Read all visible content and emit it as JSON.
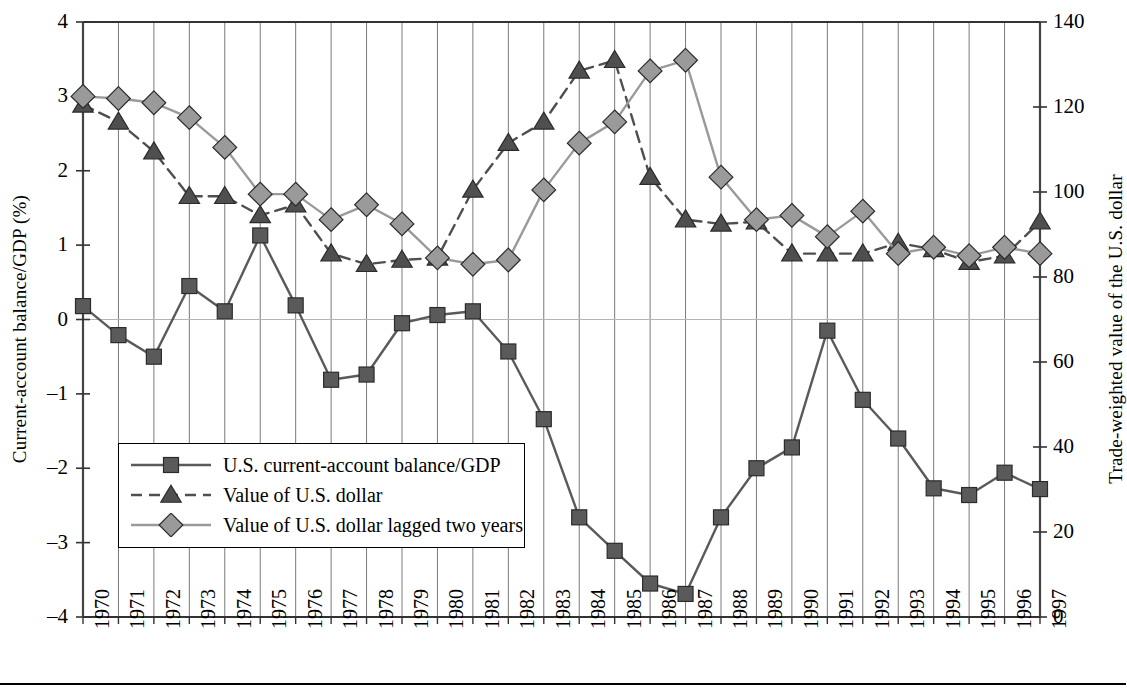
{
  "axes": {
    "y_left": {
      "title": "Current-account balance/GDP (%)",
      "ticks": [
        "4",
        "3",
        "2",
        "1",
        "0",
        "–1",
        "–2",
        "–3",
        "–4"
      ],
      "min": -4,
      "max": 4
    },
    "y_right": {
      "title": "Trade-weighted value of the U.S. dollar",
      "ticks": [
        "140",
        "120",
        "100",
        "80",
        "60",
        "40",
        "20",
        "0"
      ],
      "min": 0,
      "max": 140
    },
    "x": {
      "ticks": [
        "1970",
        "1971",
        "1972",
        "1973",
        "1974",
        "1975",
        "1976",
        "1977",
        "1978",
        "1979",
        "1980",
        "1981",
        "1982",
        "1983",
        "1984",
        "1985",
        "1986",
        "1987",
        "1988",
        "1989",
        "1990",
        "1991",
        "1992",
        "1993",
        "1994",
        "1995",
        "1996",
        "1997"
      ]
    }
  },
  "legend": {
    "items": [
      {
        "label": "U.S. current-account balance/GDP",
        "marker": "square",
        "color": "#5a5a5a",
        "dash": "solid"
      },
      {
        "label": "Value of U.S. dollar",
        "marker": "triangle",
        "color": "#4f4f4f",
        "dash": "dashed"
      },
      {
        "label": "Value of U.S. dollar lagged two years",
        "marker": "diamond",
        "color": "#9a9a9a",
        "dash": "solid"
      }
    ]
  },
  "colors": {
    "balance": "#5a5a5a",
    "dollar": "#4f4f4f",
    "dollar_lagged": "#9a9a9a",
    "grid": "#7a7a7a",
    "axis": "#3c3c3c",
    "zero_line": "#b4b4b4"
  },
  "chart_data": {
    "type": "line",
    "title": "",
    "xlabel": "",
    "ylabel": "Current-account balance/GDP (%)",
    "y2label": "Trade-weighted value of the U.S. dollar",
    "xlim": [
      1970,
      1997
    ],
    "ylim": [
      -4,
      4
    ],
    "y2lim": [
      0,
      140
    ],
    "grid": true,
    "legend_position": "inside-lower-left",
    "x": [
      1970,
      1971,
      1972,
      1973,
      1974,
      1975,
      1976,
      1977,
      1978,
      1979,
      1980,
      1981,
      1982,
      1983,
      1984,
      1985,
      1986,
      1987,
      1988,
      1989,
      1990,
      1991,
      1992,
      1993,
      1994,
      1995,
      1996,
      1997
    ],
    "series": [
      {
        "name": "U.S. current-account balance/GDP",
        "axis": "left",
        "unit": "%",
        "marker": "square",
        "dash": "solid",
        "color": "#5a5a5a",
        "values": [
          0.18,
          -0.21,
          -0.5,
          0.45,
          0.11,
          1.13,
          0.19,
          -0.81,
          -0.74,
          -0.05,
          0.06,
          0.11,
          -0.43,
          -1.34,
          -2.66,
          -3.11,
          -3.55,
          -3.69,
          -2.66,
          -2.0,
          -1.72,
          -0.15,
          -1.08,
          -1.6,
          -2.27,
          -2.36,
          -2.06,
          -2.28
        ]
      },
      {
        "name": "Value of U.S. dollar",
        "axis": "right",
        "unit": "index",
        "marker": "triangle",
        "dash": "dashed",
        "color": "#4f4f4f",
        "values": [
          120.5,
          116.5,
          109.5,
          99.0,
          99.0,
          94.5,
          97.0,
          85.5,
          83.0,
          84.0,
          84.5,
          100.5,
          111.5,
          116.5,
          128.5,
          131.0,
          103.5,
          93.5,
          92.5,
          93.0,
          85.5,
          85.5,
          85.5,
          88.0,
          86.5,
          83.5,
          85.0,
          93.0
        ]
      },
      {
        "name": "Value of U.S. dollar lagged two years",
        "axis": "right",
        "unit": "index",
        "marker": "diamond",
        "dash": "solid",
        "color": "#9a9a9a",
        "values": [
          122.5,
          122.0,
          121.0,
          117.5,
          110.5,
          99.5,
          99.5,
          93.5,
          97.0,
          92.5,
          84.5,
          83.0,
          84.0,
          100.5,
          111.5,
          116.5,
          128.5,
          131.0,
          103.5,
          93.5,
          94.5,
          89.5,
          95.5,
          85.5,
          87.0,
          85.0,
          87.0,
          85.5
        ]
      }
    ]
  }
}
